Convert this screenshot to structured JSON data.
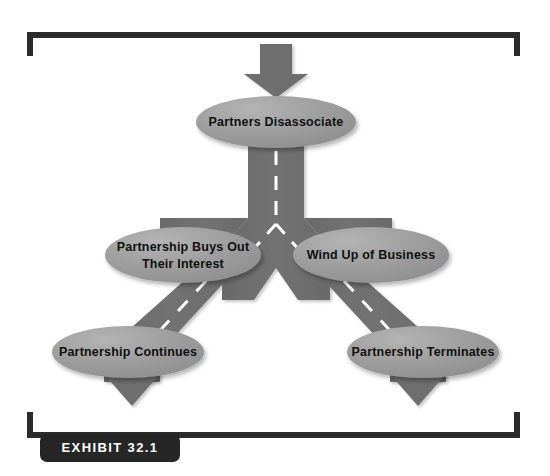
{
  "figure": {
    "title_badge": "EXHIBIT 32.1",
    "background_color": "#ffffff",
    "bracket_color": "#2b2b2b",
    "road_color": "#6e6e6e",
    "road_dash_color": "#ffffff",
    "node_fill_color": "#9a9a9a",
    "node_text_color": "#111111",
    "badge_fill_color": "#262626",
    "badge_text_color": "#ffffff"
  },
  "nodes": [
    {
      "id": "partners-disassociate",
      "label": "Partners Disassociate",
      "lines": [
        "Partners Disassociate"
      ],
      "cx": 276,
      "cy": 122,
      "rx": 80,
      "ry": 26
    },
    {
      "id": "partnership-buys-out",
      "label": "Partnership Buys Out Their Interest",
      "lines": [
        "Partnership Buys Out",
        "Their Interest"
      ],
      "cx": 183,
      "cy": 255,
      "rx": 78,
      "ry": 28
    },
    {
      "id": "wind-up-of-business",
      "label": "Wind Up of Business",
      "lines": [
        "Wind Up of Business"
      ],
      "cx": 371,
      "cy": 255,
      "rx": 78,
      "ry": 28
    },
    {
      "id": "partnership-continues",
      "label": "Partnership Continues",
      "lines": [
        "Partnership Continues"
      ],
      "cx": 128,
      "cy": 352,
      "rx": 76,
      "ry": 26
    },
    {
      "id": "partnership-terminates",
      "label": "Partnership Terminates",
      "lines": [
        "Partnership Terminates"
      ],
      "cx": 423,
      "cy": 352,
      "rx": 76,
      "ry": 26
    }
  ],
  "arrows": [
    {
      "id": "entry-arrow",
      "direction": "down",
      "target": "partners-disassociate"
    },
    {
      "id": "exit-arrow-left",
      "direction": "down",
      "source": "partnership-continues"
    },
    {
      "id": "exit-arrow-right",
      "direction": "down",
      "source": "partnership-terminates"
    }
  ],
  "roads": [
    {
      "id": "road-trunk",
      "from": "partners-disassociate",
      "to": "fork-junction"
    },
    {
      "id": "road-fork-left",
      "from": "fork-junction",
      "to": "partnership-buys-out"
    },
    {
      "id": "road-fork-right",
      "from": "fork-junction",
      "to": "wind-up-of-business"
    },
    {
      "id": "road-left-branch",
      "from": "partnership-buys-out",
      "to": "partnership-continues"
    },
    {
      "id": "road-right-branch",
      "from": "wind-up-of-business",
      "to": "partnership-terminates"
    }
  ]
}
